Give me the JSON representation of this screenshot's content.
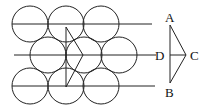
{
  "diagram": {
    "stroke_color": "#222222",
    "background": "#ffffff",
    "circles": {
      "radius": 18,
      "rows": [
        {
          "y": 24,
          "x": [
            30,
            66,
            101
          ]
        },
        {
          "y": 55,
          "x": [
            48,
            84,
            119
          ]
        },
        {
          "y": 86,
          "x": [
            30,
            66,
            101
          ]
        }
      ]
    },
    "lines": [
      {
        "x1": 12,
        "y1": 24,
        "x2": 152,
        "y2": 24
      },
      {
        "x1": 14,
        "y1": 55,
        "x2": 156,
        "y2": 55
      },
      {
        "x1": 12,
        "y1": 86,
        "x2": 155,
        "y2": 86
      }
    ],
    "inner_triangle": [
      [
        66,
        27
      ],
      [
        66,
        87
      ],
      [
        83,
        55
      ]
    ],
    "right_triangle": {
      "A": [
        170,
        25
      ],
      "B": [
        170,
        83
      ],
      "C": [
        186,
        55
      ],
      "D": [
        170,
        55
      ]
    },
    "labels": {
      "A": "A",
      "B": "B",
      "C": "C",
      "D": "D"
    }
  }
}
